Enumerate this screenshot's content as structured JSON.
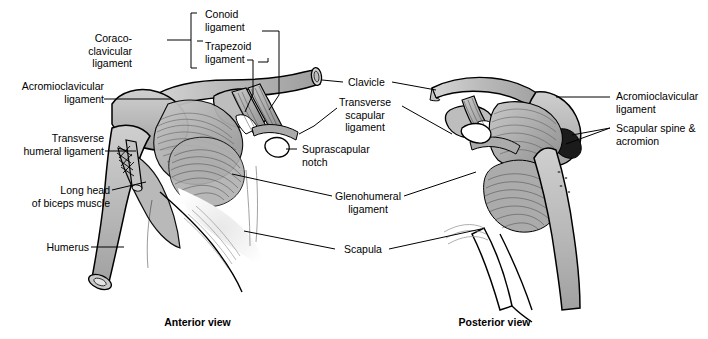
{
  "figure": {
    "background": "#ffffff",
    "bone_fill": "#b9b9b9",
    "ligament_fill": "#9a9a9a",
    "outline": "#000000"
  },
  "captions": {
    "anterior": "Anterior view",
    "posterior": "Posterior view"
  },
  "labels": {
    "coracoclavicular": "Coraco-\nclavicular\nligament",
    "conoid": "Conoid\nligament",
    "trapezoid": "Trapezoid\nligament",
    "acromioclavicular_left": "Acromioclavicular\nligament",
    "transverse_humeral": "Transverse\nhumeral ligament",
    "long_head_biceps": "Long head\nof biceps muscle",
    "humerus": "Humerus",
    "clavicle": "Clavicle",
    "transverse_scapular": "Transverse\nscapular\nligament",
    "suprascapular_notch": "Suprascapular\nnotch",
    "glenohumeral": "Glenohumeral\nligament",
    "scapula": "Scapula",
    "acromioclavicular_right": "Acromioclavicular\nligament",
    "scapular_spine_acromion": "Scapular spine &\nacromion"
  },
  "icons": {
    "bracket": "bracket-icon",
    "leader": "leader-line-icon"
  }
}
